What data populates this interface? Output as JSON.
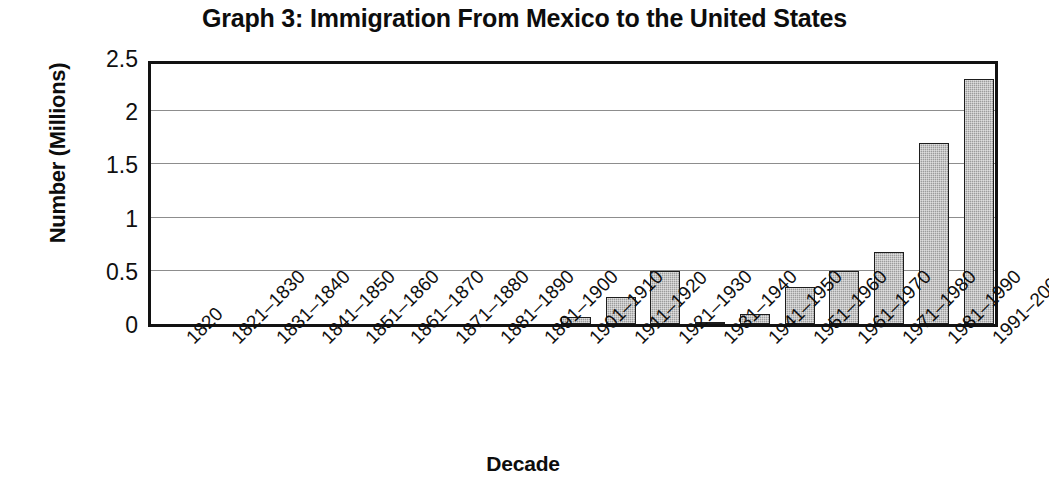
{
  "chart_data": {
    "type": "bar",
    "title": "Graph 3: Immigration From Mexico to the United States",
    "xlabel": "Decade",
    "ylabel": "Number (Millions)",
    "ylim": [
      0,
      2.5
    ],
    "yticks": [
      "0",
      "0.5",
      "1",
      "1.5",
      "2",
      "2.5"
    ],
    "ytick_values": [
      0,
      0.5,
      1,
      1.5,
      2,
      2.5
    ],
    "grid": true,
    "legend": "none",
    "bar_color": "#9c9c9c",
    "bar_edge_color": "#1d1d1d",
    "categories": [
      "1820",
      "1821–1830",
      "1831–1840",
      "1841–1850",
      "1851–1860",
      "1861–1870",
      "1871–1880",
      "1881–1890",
      "1891–1900",
      "1901–1910",
      "1911–1920",
      "1921–1930",
      "1931–1940",
      "1941–1950",
      "1951–1960",
      "1961–1970",
      "1971–1980",
      "1981–1990",
      "1991–2000"
    ],
    "values": [
      0,
      0,
      0,
      0,
      0,
      0,
      0,
      0,
      0,
      0.07,
      0.25,
      0.5,
      0.02,
      0.09,
      0.35,
      0.5,
      0.68,
      1.7,
      2.3
    ]
  }
}
